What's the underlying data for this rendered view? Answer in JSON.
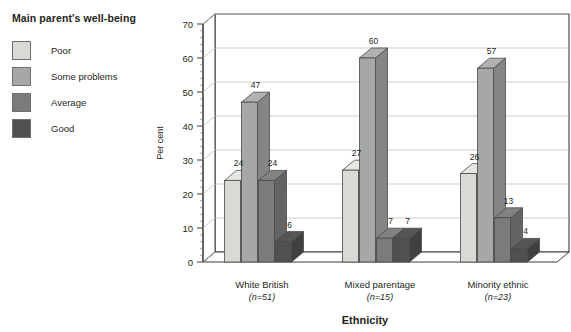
{
  "legend": {
    "title": "Main parent's well-being",
    "items": [
      {
        "label": "Poor",
        "color": "#d9dad6"
      },
      {
        "label": "Some problems",
        "color": "#a6a8a5"
      },
      {
        "label": "Average",
        "color": "#7a7c7a"
      },
      {
        "label": "Good",
        "color": "#4f5150"
      }
    ]
  },
  "chart_data": {
    "type": "bar",
    "title": "",
    "xlabel": "Ethnicity",
    "ylabel": "Per cent",
    "ylim": [
      0,
      70
    ],
    "ytick_step": 10,
    "yticks": [
      "0",
      "10",
      "20",
      "30",
      "40",
      "50",
      "60",
      "70"
    ],
    "grid": true,
    "legend_position": "left-outside",
    "three_d": true,
    "categories": [
      "White British",
      "Mixed parentage",
      "Minority ethnic"
    ],
    "category_sublabels": [
      "(n=51)",
      "(n=15)",
      "(n=23)"
    ],
    "series": [
      {
        "name": "Poor",
        "color": "#d9dad6",
        "values": [
          24,
          27,
          26
        ]
      },
      {
        "name": "Some problems",
        "color": "#a6a8a5",
        "values": [
          47,
          60,
          57
        ]
      },
      {
        "name": "Average",
        "color": "#7a7c7a",
        "values": [
          24,
          7,
          13
        ]
      },
      {
        "name": "Good",
        "color": "#4f5150",
        "values": [
          6,
          7,
          4
        ]
      }
    ]
  }
}
